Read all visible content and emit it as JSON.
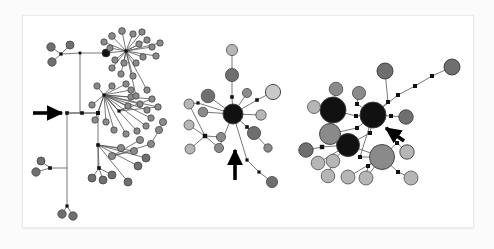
{
  "figure": {
    "kind": "haplotype-network-figure",
    "background": "#fbfbfb",
    "panel_background": "#ffffff",
    "panel_border": "#ebebeb",
    "edge_color": "#555555",
    "node_stroke": "#3a3a3a",
    "mutation_marker_color": "#111111",
    "arrow_color": "#000000",
    "palette": {
      "black": "#111111",
      "dark_gray": "#6f6f6f",
      "medium_gray": "#8a8a8a",
      "light_gray": "#b6b6b6",
      "pale_gray": "#c9c9c9"
    }
  },
  "chart_data": {
    "type": "scatter",
    "title": "",
    "xlabel": "",
    "ylabel": "",
    "panels": [
      {
        "id": "panel-1",
        "name": "left-network",
        "node_count": 78,
        "hub_count": 3,
        "arrow": {
          "points_to": "central-junction-node",
          "direction": "right",
          "x": 62,
          "y": 113
        },
        "dominant_shade": "medium_gray",
        "topology": "two large star clusters linked by a long backbone with peripheral chains"
      },
      {
        "id": "panel-2",
        "name": "middle-network",
        "node_count": 21,
        "hub_count": 1,
        "arrow": {
          "points_to": "satellite-node-lower-left",
          "direction": "up-right",
          "x": 239,
          "y": 175
        },
        "dominant_shade": "dark_gray",
        "topology": "single black central hub with radiating spokes plus a crossing secondary star"
      },
      {
        "id": "panel-3",
        "name": "right-network",
        "node_count": 28,
        "hub_count": 3,
        "arrow": {
          "points_to": "black-central-hub",
          "direction": "up-left",
          "x": 392,
          "y": 135
        },
        "dominant_shade": "light_gray",
        "topology": "three large hubs (two black, one gray) with many light-gray satellites and one long stepped branch"
      }
    ],
    "nodes": {
      "panel_1": [
        {
          "x": 51,
          "y": 47,
          "r": 4.2,
          "shade": "dark_gray"
        },
        {
          "x": 70,
          "y": 45,
          "r": 4.0,
          "shade": "dark_gray"
        },
        {
          "x": 52,
          "y": 62,
          "r": 4.2,
          "shade": "dark_gray"
        },
        {
          "x": 61,
          "y": 54,
          "r": 1.6,
          "shade": "junction"
        },
        {
          "x": 80,
          "y": 53,
          "r": 1.4,
          "shade": "junction"
        },
        {
          "x": 106,
          "y": 53,
          "r": 4.0,
          "shade": "black"
        },
        {
          "x": 126,
          "y": 51,
          "r": 1.6,
          "shade": "junction"
        },
        {
          "x": 112,
          "y": 36,
          "r": 3.4,
          "shade": "medium_gray"
        },
        {
          "x": 122,
          "y": 31,
          "r": 3.4,
          "shade": "medium_gray"
        },
        {
          "x": 133,
          "y": 34,
          "r": 3.2,
          "shade": "medium_gray"
        },
        {
          "x": 142,
          "y": 32,
          "r": 3.2,
          "shade": "medium_gray"
        },
        {
          "x": 147,
          "y": 40,
          "r": 3.2,
          "shade": "medium_gray"
        },
        {
          "x": 139,
          "y": 44,
          "r": 3.2,
          "shade": "medium_gray"
        },
        {
          "x": 152,
          "y": 47,
          "r": 3.2,
          "shade": "medium_gray"
        },
        {
          "x": 160,
          "y": 43,
          "r": 3.2,
          "shade": "medium_gray"
        },
        {
          "x": 156,
          "y": 56,
          "r": 3.2,
          "shade": "medium_gray"
        },
        {
          "x": 143,
          "y": 57,
          "r": 3.2,
          "shade": "medium_gray"
        },
        {
          "x": 136,
          "y": 63,
          "r": 3.2,
          "shade": "medium_gray"
        },
        {
          "x": 124,
          "y": 63,
          "r": 3.2,
          "shade": "medium_gray"
        },
        {
          "x": 115,
          "y": 60,
          "r": 3.2,
          "shade": "medium_gray"
        },
        {
          "x": 110,
          "y": 48,
          "r": 3.2,
          "shade": "medium_gray"
        },
        {
          "x": 104,
          "y": 42,
          "r": 3.2,
          "shade": "medium_gray"
        },
        {
          "x": 112,
          "y": 68,
          "r": 3.2,
          "shade": "medium_gray"
        },
        {
          "x": 121,
          "y": 74,
          "r": 3.2,
          "shade": "medium_gray"
        },
        {
          "x": 133,
          "y": 76,
          "r": 3.2,
          "shade": "medium_gray"
        },
        {
          "x": 104,
          "y": 95,
          "r": 1.6,
          "shade": "junction"
        },
        {
          "x": 97,
          "y": 86,
          "r": 3.2,
          "shade": "medium_gray"
        },
        {
          "x": 112,
          "y": 86,
          "r": 3.2,
          "shade": "medium_gray"
        },
        {
          "x": 126,
          "y": 84,
          "r": 3.2,
          "shade": "medium_gray"
        },
        {
          "x": 131,
          "y": 90,
          "r": 3.2,
          "shade": "medium_gray"
        },
        {
          "x": 131,
          "y": 97,
          "r": 3.2,
          "shade": "medium_gray"
        },
        {
          "x": 140,
          "y": 104,
          "r": 3.2,
          "shade": "medium_gray"
        },
        {
          "x": 147,
          "y": 110,
          "r": 3.2,
          "shade": "medium_gray"
        },
        {
          "x": 151,
          "y": 118,
          "r": 3.2,
          "shade": "medium_gray"
        },
        {
          "x": 146,
          "y": 126,
          "r": 3.2,
          "shade": "medium_gray"
        },
        {
          "x": 137,
          "y": 131,
          "r": 3.2,
          "shade": "medium_gray"
        },
        {
          "x": 126,
          "y": 134,
          "r": 3.2,
          "shade": "medium_gray"
        },
        {
          "x": 114,
          "y": 130,
          "r": 3.2,
          "shade": "medium_gray"
        },
        {
          "x": 106,
          "y": 122,
          "r": 3.2,
          "shade": "medium_gray"
        },
        {
          "x": 95,
          "y": 120,
          "r": 3.2,
          "shade": "medium_gray"
        },
        {
          "x": 92,
          "y": 105,
          "r": 3.2,
          "shade": "medium_gray"
        },
        {
          "x": 119,
          "y": 111,
          "r": 1.6,
          "shade": "junction"
        },
        {
          "x": 128,
          "y": 106,
          "r": 3.2,
          "shade": "medium_gray"
        },
        {
          "x": 158,
          "y": 107,
          "r": 3.2,
          "shade": "medium_gray"
        },
        {
          "x": 152,
          "y": 99,
          "r": 3.2,
          "shade": "medium_gray"
        },
        {
          "x": 67,
          "y": 113,
          "r": 1.8,
          "shade": "junction"
        },
        {
          "x": 82,
          "y": 113,
          "r": 1.8,
          "shade": "junction"
        },
        {
          "x": 98,
          "y": 113,
          "r": 2.0,
          "shade": "junction"
        },
        {
          "x": 50,
          "y": 168,
          "r": 1.8,
          "shade": "junction"
        },
        {
          "x": 41,
          "y": 161,
          "r": 4.0,
          "shade": "dark_gray"
        },
        {
          "x": 36,
          "y": 172,
          "r": 4.2,
          "shade": "dark_gray"
        },
        {
          "x": 67,
          "y": 206,
          "r": 1.6,
          "shade": "junction"
        },
        {
          "x": 62,
          "y": 214,
          "r": 4.2,
          "shade": "dark_gray"
        },
        {
          "x": 73,
          "y": 216,
          "r": 4.2,
          "shade": "dark_gray"
        },
        {
          "x": 98,
          "y": 145,
          "r": 1.8,
          "shade": "junction"
        },
        {
          "x": 99,
          "y": 168,
          "r": 1.8,
          "shade": "junction"
        },
        {
          "x": 92,
          "y": 178,
          "r": 4.0,
          "shade": "dark_gray"
        },
        {
          "x": 103,
          "y": 180,
          "r": 4.0,
          "shade": "dark_gray"
        },
        {
          "x": 112,
          "y": 175,
          "r": 4.0,
          "shade": "dark_gray"
        },
        {
          "x": 128,
          "y": 182,
          "r": 4.0,
          "shade": "dark_gray"
        },
        {
          "x": 138,
          "y": 166,
          "r": 4.0,
          "shade": "dark_gray"
        },
        {
          "x": 146,
          "y": 158,
          "r": 4.0,
          "shade": "dark_gray"
        },
        {
          "x": 134,
          "y": 151,
          "r": 3.6,
          "shade": "medium_gray"
        },
        {
          "x": 121,
          "y": 148,
          "r": 3.6,
          "shade": "medium_gray"
        },
        {
          "x": 112,
          "y": 156,
          "r": 3.6,
          "shade": "medium_gray"
        },
        {
          "x": 140,
          "y": 140,
          "r": 3.6,
          "shade": "medium_gray"
        },
        {
          "x": 151,
          "y": 144,
          "r": 3.6,
          "shade": "medium_gray"
        },
        {
          "x": 159,
          "y": 130,
          "r": 3.6,
          "shade": "medium_gray"
        },
        {
          "x": 163,
          "y": 122,
          "r": 3.6,
          "shade": "medium_gray"
        },
        {
          "x": 147,
          "y": 90,
          "r": 3.2,
          "shade": "medium_gray"
        },
        {
          "x": 136,
          "y": 96,
          "r": 3.2,
          "shade": "medium_gray"
        }
      ],
      "panel_2": [
        {
          "x": 233,
          "y": 114,
          "r": 10.0,
          "shade": "black",
          "label": "central-hub"
        },
        {
          "x": 232,
          "y": 50,
          "r": 5.6,
          "shade": "light_gray"
        },
        {
          "x": 232,
          "y": 75,
          "r": 6.6,
          "shade": "dark_gray"
        },
        {
          "x": 232,
          "y": 97,
          "r": 1.8,
          "shade": "junction"
        },
        {
          "x": 208,
          "y": 96,
          "r": 6.8,
          "shade": "dark_gray"
        },
        {
          "x": 247,
          "y": 93,
          "r": 4.6,
          "shade": "medium_gray"
        },
        {
          "x": 257,
          "y": 100,
          "r": 1.8,
          "shade": "junction"
        },
        {
          "x": 273,
          "y": 92,
          "r": 7.6,
          "shade": "pale_gray"
        },
        {
          "x": 261,
          "y": 115,
          "r": 5.2,
          "shade": "light_gray"
        },
        {
          "x": 254,
          "y": 133,
          "r": 6.6,
          "shade": "dark_gray"
        },
        {
          "x": 268,
          "y": 148,
          "r": 4.2,
          "shade": "medium_gray"
        },
        {
          "x": 247,
          "y": 127,
          "r": 1.8,
          "shade": "junction"
        },
        {
          "x": 198,
          "y": 103,
          "r": 1.6,
          "shade": "junction"
        },
        {
          "x": 189,
          "y": 104,
          "r": 5.0,
          "shade": "light_gray"
        },
        {
          "x": 203,
          "y": 112,
          "r": 4.8,
          "shade": "medium_gray"
        },
        {
          "x": 189,
          "y": 125,
          "r": 5.0,
          "shade": "light_gray"
        },
        {
          "x": 205,
          "y": 136,
          "r": 2.2,
          "shade": "junction"
        },
        {
          "x": 190,
          "y": 149,
          "r": 5.0,
          "shade": "light_gray"
        },
        {
          "x": 219,
          "y": 148,
          "r": 4.6,
          "shade": "medium_gray"
        },
        {
          "x": 221,
          "y": 137,
          "r": 4.6,
          "shade": "medium_gray"
        },
        {
          "x": 247,
          "y": 160,
          "r": 1.6,
          "shade": "junction"
        },
        {
          "x": 259,
          "y": 172,
          "r": 1.6,
          "shade": "junction"
        },
        {
          "x": 272,
          "y": 182,
          "r": 5.6,
          "shade": "dark_gray"
        }
      ],
      "panel_3": [
        {
          "x": 373,
          "y": 115,
          "r": 13.0,
          "shade": "black",
          "label": "main-black-hub"
        },
        {
          "x": 333,
          "y": 110,
          "r": 13.0,
          "shade": "black",
          "label": "second-black-hub"
        },
        {
          "x": 348,
          "y": 145,
          "r": 11.5,
          "shade": "black",
          "label": "third-black-hub"
        },
        {
          "x": 382,
          "y": 157,
          "r": 12.5,
          "shade": "medium_gray",
          "label": "gray-hub"
        },
        {
          "x": 330,
          "y": 134,
          "r": 10.5,
          "shade": "medium_gray"
        },
        {
          "x": 314,
          "y": 107,
          "r": 6.5,
          "shade": "light_gray"
        },
        {
          "x": 336,
          "y": 89,
          "r": 6.8,
          "shade": "medium_gray"
        },
        {
          "x": 359,
          "y": 93,
          "r": 6.6,
          "shade": "medium_gray"
        },
        {
          "x": 357,
          "y": 104,
          "r": 2.0,
          "shade": "junction"
        },
        {
          "x": 356,
          "y": 116,
          "r": 2.0,
          "shade": "junction"
        },
        {
          "x": 357,
          "y": 128,
          "r": 2.0,
          "shade": "junction"
        },
        {
          "x": 370,
          "y": 133,
          "r": 2.0,
          "shade": "junction"
        },
        {
          "x": 388,
          "y": 102,
          "r": 2.0,
          "shade": "junction"
        },
        {
          "x": 385,
          "y": 71,
          "r": 8.0,
          "shade": "dark_gray"
        },
        {
          "x": 391,
          "y": 116,
          "r": 2.0,
          "shade": "junction"
        },
        {
          "x": 406,
          "y": 117,
          "r": 7.2,
          "shade": "dark_gray"
        },
        {
          "x": 398,
          "y": 95,
          "r": 2.0,
          "shade": "junction"
        },
        {
          "x": 415,
          "y": 86,
          "r": 2.0,
          "shade": "junction"
        },
        {
          "x": 432,
          "y": 76,
          "r": 2.0,
          "shade": "junction"
        },
        {
          "x": 452,
          "y": 67,
          "r": 8.0,
          "shade": "dark_gray"
        },
        {
          "x": 322,
          "y": 147,
          "r": 2.2,
          "shade": "junction"
        },
        {
          "x": 306,
          "y": 150,
          "r": 7.2,
          "shade": "dark_gray"
        },
        {
          "x": 318,
          "y": 163,
          "r": 6.8,
          "shade": "light_gray"
        },
        {
          "x": 333,
          "y": 161,
          "r": 6.8,
          "shade": "light_gray"
        },
        {
          "x": 328,
          "y": 176,
          "r": 6.8,
          "shade": "light_gray"
        },
        {
          "x": 348,
          "y": 177,
          "r": 7.0,
          "shade": "light_gray"
        },
        {
          "x": 366,
          "y": 178,
          "r": 7.0,
          "shade": "light_gray"
        },
        {
          "x": 368,
          "y": 166,
          "r": 2.0,
          "shade": "junction"
        },
        {
          "x": 398,
          "y": 172,
          "r": 2.0,
          "shade": "junction"
        },
        {
          "x": 411,
          "y": 178,
          "r": 7.0,
          "shade": "light_gray"
        },
        {
          "x": 407,
          "y": 152,
          "r": 7.2,
          "shade": "light_gray"
        },
        {
          "x": 397,
          "y": 143,
          "r": 2.0,
          "shade": "junction"
        },
        {
          "x": 360,
          "y": 157,
          "r": 2.0,
          "shade": "junction"
        }
      ]
    },
    "arrows": [
      {
        "id": "arrow-1",
        "x1": 33,
        "y1": 113,
        "x2": 62,
        "y2": 113,
        "panel": "panel-1"
      },
      {
        "id": "arrow-2",
        "x1": 235,
        "y1": 180,
        "x2": 235,
        "y2": 150,
        "panel": "panel-2"
      },
      {
        "id": "arrow-3",
        "x1": 404,
        "y1": 141,
        "x2": 386,
        "y2": 128,
        "panel": "panel-3"
      }
    ]
  }
}
